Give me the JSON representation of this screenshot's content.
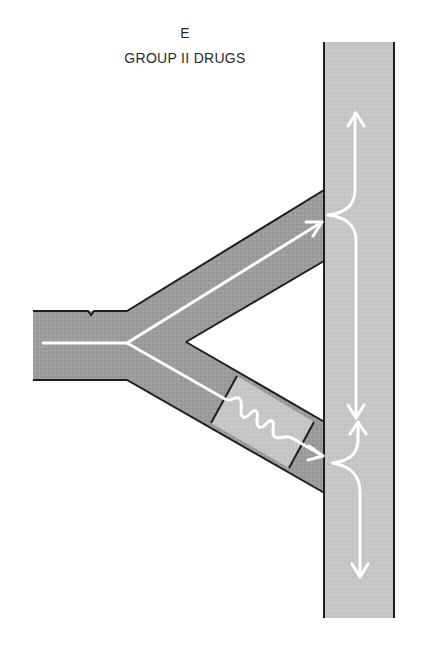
{
  "figure": {
    "panel_letter": "E",
    "title": "GROUP II DRUGS"
  },
  "colors": {
    "background": "#ffffff",
    "vessel_dark": "#9a9a9a",
    "vessel_light": "#c4c4c4",
    "slow_segment": "#c8c8c8",
    "outline": "#1e1e1e",
    "flow_line": "#ffffff",
    "text": "#2a2a2a"
  },
  "diagram": {
    "elements": [
      {
        "id": "inlet-stem",
        "description": "horizontal inflow vessel from left"
      },
      {
        "id": "upper-branch",
        "description": "upper diagonal branch, unobstructed flow to main vessel"
      },
      {
        "id": "lower-branch",
        "description": "lower diagonal branch with slowed-conduction segment (wavy path)"
      },
      {
        "id": "main-vessel",
        "description": "vertical receiving vessel"
      },
      {
        "id": "upper-junction",
        "description": "flow splits up and down at upper entry"
      },
      {
        "id": "lower-junction",
        "description": "flow splits up and down at lower entry; collides with descending wave"
      }
    ]
  }
}
